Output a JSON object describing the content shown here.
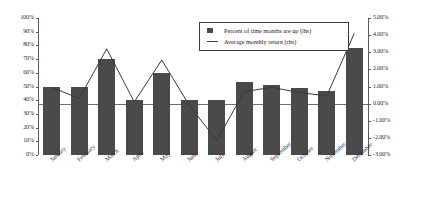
{
  "chart_data": {
    "type": "bar",
    "title": "",
    "subtitle": "",
    "xlabel": "",
    "ylabel": "",
    "categories": [
      "January",
      "February",
      "March",
      "April",
      "May",
      "June",
      "July",
      "August",
      "September",
      "October",
      "November",
      "December"
    ],
    "series": [
      {
        "name": "Percent of time months are up (lhs)",
        "type": "bar",
        "axis": "left",
        "color": "#4a4a4a",
        "values": [
          50,
          50,
          70,
          40,
          60,
          40,
          40,
          53,
          51,
          49,
          47,
          78
        ]
      },
      {
        "name": "Average monthly return (rhs)",
        "type": "line",
        "axis": "right",
        "color": "#3a3a3a",
        "values": [
          0.95,
          0.3,
          3.2,
          0.1,
          2.55,
          -0.1,
          -2.15,
          0.7,
          0.95,
          0.65,
          0.45,
          4.1
        ]
      }
    ],
    "left_axis": {
      "min": 0,
      "max": 100,
      "step": 10,
      "ticks": [
        "0%",
        "10%",
        "20%",
        "30%",
        "40%",
        "50%",
        "60%",
        "70%",
        "80%",
        "90%",
        "100%"
      ]
    },
    "right_axis": {
      "min": -3,
      "max": 5,
      "step": 1,
      "ticks": [
        "-3.00%",
        "-2.00%",
        "-1.00%",
        "0.00%",
        "1.00%",
        "2.00%",
        "3.00%",
        "4.00%",
        "5.00%"
      ]
    },
    "legend": {
      "position": "top-right-inside",
      "entries": [
        {
          "label": "Percent of time months are up (lhs)",
          "marker": "square"
        },
        {
          "label": "Average monthly return (rhs)",
          "marker": "line"
        }
      ]
    },
    "grid": false
  }
}
